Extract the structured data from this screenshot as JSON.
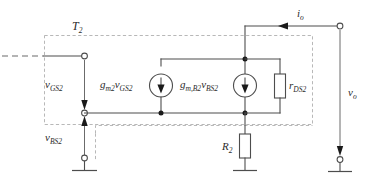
{
  "diagram": {
    "labels": {
      "transistor_block": "T",
      "transistor_block_sub": "2",
      "vgs": "v",
      "vgs_sub": "GS2",
      "vbs": "v",
      "vbs_sub": "BS2",
      "source1_gm": "g",
      "source1_gm_sub": "m2",
      "source1_v": "v",
      "source1_v_sub": "GS2",
      "source2_gm": "g",
      "source2_gm_sub": "m,B2",
      "source2_v": "v",
      "source2_v_sub": "BS2",
      "rds": "r",
      "rds_sub": "DS2",
      "r2": "R",
      "r2_sub": "2",
      "io": "i",
      "io_sub": "o",
      "vo": "v",
      "vo_sub": "o"
    },
    "colors": {
      "wire": "#4d4d4d",
      "dashed_box": "#b0b0b0",
      "node": "#1a1a1a",
      "text": "#2b2b2b",
      "background": "#ffffff"
    },
    "components": [
      {
        "name": "current-source-gm2-vgs2",
        "type": "dependent-current-source",
        "direction": "down"
      },
      {
        "name": "current-source-gmb2-vbs2",
        "type": "dependent-current-source",
        "direction": "down"
      },
      {
        "name": "resistor-rds2",
        "type": "resistor",
        "orientation": "vertical"
      },
      {
        "name": "resistor-r2",
        "type": "resistor",
        "orientation": "vertical"
      }
    ],
    "terminals": [
      {
        "name": "gate-terminal",
        "type": "open-circle"
      },
      {
        "name": "bulk-source-terminal",
        "type": "open-circle"
      },
      {
        "name": "source-node-terminal",
        "type": "open-circle"
      },
      {
        "name": "output-top-terminal",
        "type": "open-circle"
      },
      {
        "name": "output-bottom-terminal",
        "type": "open-circle"
      }
    ],
    "grounds": [
      {
        "name": "ground-left"
      },
      {
        "name": "ground-r2"
      },
      {
        "name": "ground-output"
      }
    ]
  }
}
